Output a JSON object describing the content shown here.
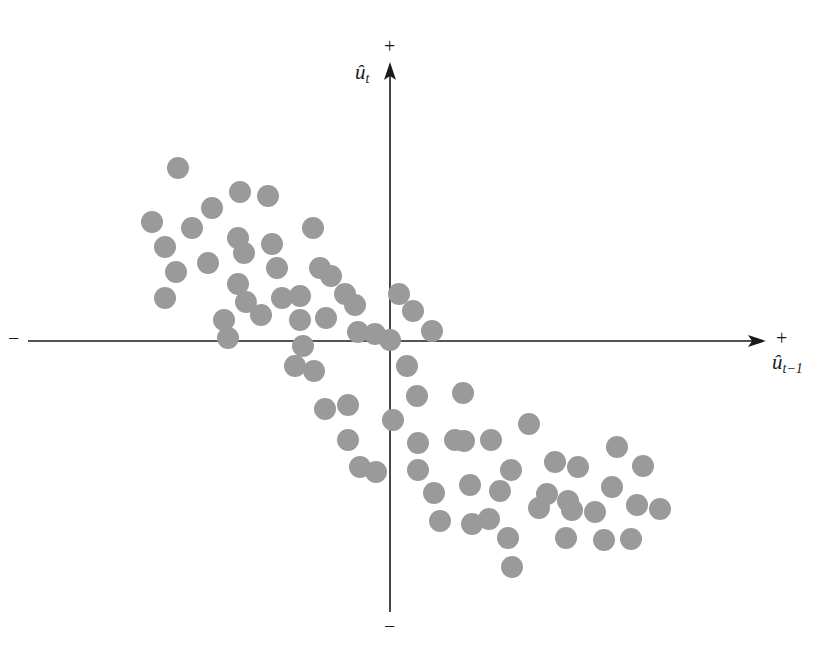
{
  "figure": {
    "background_color": "#ffffff",
    "axis_color": "#1a1a1a",
    "point_color": "#9a9a9a",
    "point_radius": 11
  },
  "axes": {
    "y_axis": {
      "label": "û",
      "label_subscript": "t",
      "positive_sign": "+",
      "negative_sign": "−",
      "arrow": "up-arrow"
    },
    "x_axis": {
      "label": "û",
      "label_subscript": "t−1",
      "positive_sign": "+",
      "negative_sign": "−",
      "arrow": "right-arrow"
    }
  },
  "chart_data": {
    "type": "scatter",
    "title": "",
    "subtitle": "",
    "xlabel": "û_{t-1}",
    "ylabel": "û_t",
    "legend": [],
    "grid": false,
    "origin_px": [
      390,
      341
    ],
    "xlim": [
      -1.0,
      1.0
    ],
    "ylim": [
      -1.0,
      1.0
    ],
    "annotations": [
      {
        "text": "+",
        "position": "top-of-y-axis"
      },
      {
        "text": "−",
        "position": "bottom-of-y-axis"
      },
      {
        "text": "+",
        "position": "right-of-x-axis"
      },
      {
        "text": "−",
        "position": "left-of-x-axis"
      }
    ],
    "n_points": 76,
    "points_px": [
      [
        178,
        168
      ],
      [
        240,
        192
      ],
      [
        212,
        208
      ],
      [
        268,
        196
      ],
      [
        152,
        222
      ],
      [
        192,
        228
      ],
      [
        238,
        238
      ],
      [
        165,
        247
      ],
      [
        244,
        253
      ],
      [
        208,
        263
      ],
      [
        272,
        244
      ],
      [
        238,
        284
      ],
      [
        313,
        228
      ],
      [
        320,
        268
      ],
      [
        176,
        272
      ],
      [
        277,
        268
      ],
      [
        282,
        298
      ],
      [
        165,
        298
      ],
      [
        300,
        296
      ],
      [
        331,
        276
      ],
      [
        345,
        294
      ],
      [
        246,
        302
      ],
      [
        355,
        305
      ],
      [
        224,
        320
      ],
      [
        261,
        315
      ],
      [
        300,
        320
      ],
      [
        326,
        318
      ],
      [
        358,
        332
      ],
      [
        375,
        334
      ],
      [
        228,
        338
      ],
      [
        303,
        346
      ],
      [
        399,
        294
      ],
      [
        413,
        311
      ],
      [
        390,
        340
      ],
      [
        432,
        331
      ],
      [
        407,
        366
      ],
      [
        314,
        371
      ],
      [
        348,
        405
      ],
      [
        325,
        409
      ],
      [
        348,
        440
      ],
      [
        360,
        467
      ],
      [
        376,
        472
      ],
      [
        417,
        396
      ],
      [
        463,
        393
      ],
      [
        418,
        443
      ],
      [
        464,
        441
      ],
      [
        491,
        440
      ],
      [
        529,
        424
      ],
      [
        511,
        470
      ],
      [
        470,
        485
      ],
      [
        555,
        462
      ],
      [
        500,
        491
      ],
      [
        434,
        493
      ],
      [
        547,
        494
      ],
      [
        440,
        521
      ],
      [
        539,
        508
      ],
      [
        472,
        524
      ],
      [
        568,
        501
      ],
      [
        578,
        467
      ],
      [
        612,
        487
      ],
      [
        617,
        447
      ],
      [
        637,
        505
      ],
      [
        595,
        512
      ],
      [
        643,
        466
      ],
      [
        508,
        538
      ],
      [
        660,
        509
      ],
      [
        512,
        567
      ],
      [
        566,
        538
      ],
      [
        604,
        540
      ],
      [
        631,
        539
      ],
      [
        572,
        510
      ],
      [
        295,
        366
      ],
      [
        393,
        420
      ],
      [
        418,
        470
      ],
      [
        455,
        440
      ],
      [
        489,
        519
      ]
    ]
  }
}
